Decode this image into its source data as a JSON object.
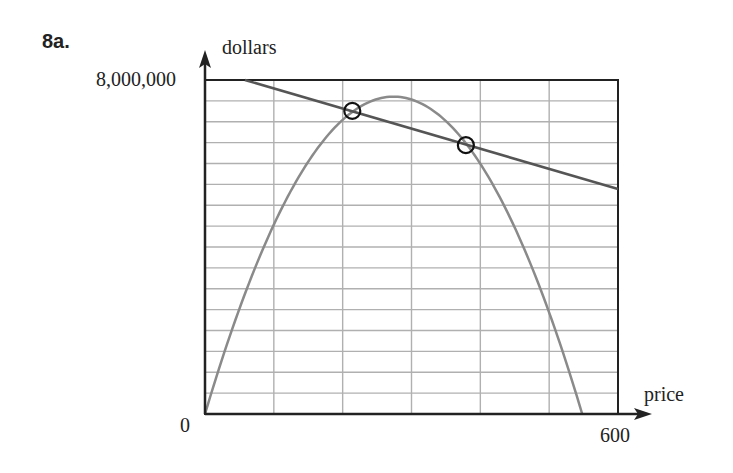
{
  "problem_label": "8a.",
  "chart_data": {
    "type": "line",
    "title": "",
    "xlabel": "price",
    "ylabel": "dollars",
    "xlim": [
      0,
      600
    ],
    "ylim": [
      0,
      8000000
    ],
    "x_tick_labels": [
      "0",
      "600"
    ],
    "y_tick_labels": [
      "0",
      "8,000,000"
    ],
    "grid": true,
    "grid_x_step": 100,
    "grid_y_step": 500000,
    "series": [
      {
        "name": "linear",
        "color": "#555555",
        "points": [
          [
            58,
            8000000
          ],
          [
            600,
            5390000
          ]
        ]
      },
      {
        "name": "parabola",
        "color": "#8a8a8a",
        "points": [
          [
            0,
            0
          ],
          [
            100,
            4100000
          ],
          [
            200,
            7050000
          ],
          [
            276,
            7600000
          ],
          [
            350,
            7000000
          ],
          [
            450,
            4200000
          ],
          [
            548,
            0
          ]
        ]
      }
    ],
    "annotations": [
      {
        "type": "circle",
        "x": 214,
        "y": 7260000
      },
      {
        "type": "circle",
        "x": 379,
        "y": 6440000
      }
    ]
  }
}
